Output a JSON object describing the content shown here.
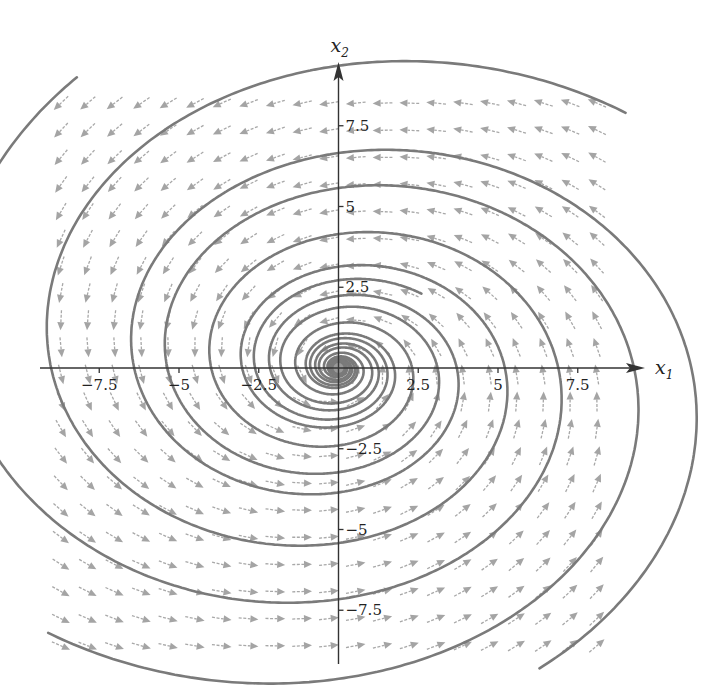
{
  "chart_data": {
    "type": "vector_field",
    "title": "",
    "xlabel": "x",
    "xlabel_sub": "1",
    "ylabel": "x",
    "ylabel_sub": "2",
    "xlim": [
      -9.4,
      9.5
    ],
    "ylim": [
      -9.5,
      9.4
    ],
    "x_ticks": [
      {
        "value": -7.5,
        "label": "−7.5"
      },
      {
        "value": -5,
        "label": "−5"
      },
      {
        "value": -2.5,
        "label": "−2.5"
      },
      {
        "value": 2.5,
        "label": "2.5"
      },
      {
        "value": 5,
        "label": "5"
      },
      {
        "value": 7.5,
        "label": "7.5"
      }
    ],
    "y_ticks": [
      {
        "value": 7.5,
        "label": "7.5"
      },
      {
        "value": 5,
        "label": "5"
      },
      {
        "value": 2.5,
        "label": "2.5"
      },
      {
        "value": -2.5,
        "label": "−2.5"
      },
      {
        "value": -5,
        "label": "−5"
      },
      {
        "value": -7.5,
        "label": "−7.5"
      }
    ],
    "system": {
      "equations": [
        "x1' = -0.22*x1 - 1.6*x2",
        "x2' = 1.0*x1 - 0.22*x2"
      ],
      "matrix": [
        [
          -0.22,
          -1.6
        ],
        [
          1.0,
          -0.22
        ]
      ],
      "equilibrium": [
        0,
        0
      ],
      "type": "stable spiral"
    },
    "field_grid": {
      "x_start": -8.7,
      "x_end": 8.6,
      "y_start": -8.6,
      "y_end": 8.7,
      "spacing": 0.84,
      "arrow_length": 0.62
    },
    "trajectories": [
      {
        "name": "curve-upper-left",
        "start": [
          -8.2,
          9.0
        ]
      },
      {
        "name": "curve-upper-right",
        "start": [
          9.0,
          7.9
        ]
      },
      {
        "name": "curve-lower-right",
        "start": [
          6.3,
          -9.3
        ]
      },
      {
        "name": "curve-lower-left",
        "start": [
          -9.1,
          -8.2
        ]
      },
      {
        "name": "curve-inner",
        "start": [
          2.6,
          2.3
        ]
      }
    ],
    "grid": false,
    "legend": null
  },
  "colors": {
    "arrow": "#a8a8a8",
    "trajectory": "#7a7a7a",
    "axis": "#333333",
    "background": "#ffffff"
  }
}
